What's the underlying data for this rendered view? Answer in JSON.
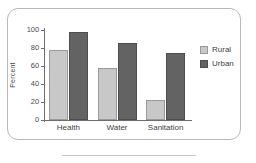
{
  "chart_data": {
    "type": "bar",
    "title": "",
    "xlabel": "",
    "ylabel": "Percent",
    "ylim": [
      0,
      100
    ],
    "yticks": [
      0,
      20,
      40,
      60,
      80,
      100
    ],
    "grid": false,
    "legend_position": "right",
    "categories": [
      "Health",
      "Water",
      "Sanitation"
    ],
    "series": [
      {
        "name": "Rural",
        "color": "#c8c8c8",
        "values": [
          78,
          58,
          22
        ]
      },
      {
        "name": "Urban",
        "color": "#636363",
        "values": [
          98,
          86,
          74
        ]
      }
    ]
  },
  "ytick_labels": [
    "0",
    "20",
    "40",
    "60",
    "80",
    "100"
  ],
  "legend": {
    "items": [
      {
        "label": "Rural"
      },
      {
        "label": "Urban"
      }
    ]
  },
  "colors": {
    "rural": "#c8c8c8",
    "urban": "#636363",
    "axis": "#6d6d6d",
    "frame": "#b9b9b9",
    "text": "#3f3f3f"
  }
}
